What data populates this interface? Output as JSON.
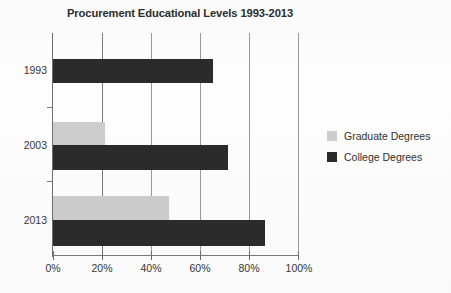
{
  "chart_data": {
    "type": "bar",
    "orientation": "horizontal",
    "title": "Procurement Educational Levels 1993-2013",
    "xlabel": "",
    "ylabel": "",
    "categories": [
      "1993",
      "2003",
      "2013"
    ],
    "series": [
      {
        "name": "Graduate Degrees",
        "color": "#cdcdcd",
        "values": [
          0,
          21,
          47
        ]
      },
      {
        "name": "College Degrees",
        "color": "#2b2b2b",
        "values": [
          65,
          71,
          86
        ]
      }
    ],
    "xlim": [
      0,
      100
    ],
    "xticks": [
      0,
      20,
      40,
      60,
      80,
      100
    ],
    "xtick_labels": [
      "0%",
      "20%",
      "40%",
      "60%",
      "80%",
      "100%"
    ],
    "grid": true,
    "grid_axis": "x",
    "legend_position": "right"
  },
  "legend": {
    "items": [
      {
        "label": "Graduate Degrees",
        "swatch": "graduate"
      },
      {
        "label": "College Degrees",
        "swatch": "college"
      }
    ]
  },
  "axis": {
    "x_tick_labels": [
      "0%",
      "20%",
      "40%",
      "60%",
      "80%",
      "100%"
    ],
    "y_tick_labels": [
      "1993",
      "2003",
      "2013"
    ]
  }
}
